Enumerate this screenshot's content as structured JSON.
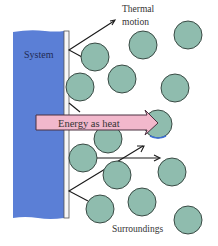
{
  "diagram": {
    "labels": {
      "system": "System",
      "thermal_motion_line1": "Thermal",
      "thermal_motion_line2": "motion",
      "energy_arrow": "Energy as heat",
      "surroundings": "Surroundings"
    },
    "colors": {
      "system_fill": "#5b7fd6",
      "wall_fill": "#f7f7f7",
      "wall_stroke": "#555555",
      "molecule_fill": "#8fbcae",
      "molecule_stroke": "#2d3b36",
      "arrow_fill": "#f2b8cc",
      "arrow_stroke": "#4a3040",
      "text_dark": "#333333",
      "system_text": "#1f2a55"
    },
    "molecules": [
      {
        "cx": 95,
        "cy": 57,
        "r": 14
      },
      {
        "cx": 143,
        "cy": 45,
        "r": 14
      },
      {
        "cx": 188,
        "cy": 35,
        "r": 14
      },
      {
        "cx": 80,
        "cy": 87,
        "r": 14
      },
      {
        "cx": 122,
        "cy": 79,
        "r": 14
      },
      {
        "cx": 175,
        "cy": 88,
        "r": 14
      },
      {
        "cx": 108,
        "cy": 139,
        "r": 14
      },
      {
        "cx": 158,
        "cy": 124,
        "r": 14
      },
      {
        "cx": 83,
        "cy": 158,
        "r": 14
      },
      {
        "cx": 117,
        "cy": 175,
        "r": 14
      },
      {
        "cx": 172,
        "cy": 172,
        "r": 14
      },
      {
        "cx": 100,
        "cy": 209,
        "r": 14
      },
      {
        "cx": 142,
        "cy": 202,
        "r": 14
      },
      {
        "cx": 188,
        "cy": 220,
        "r": 14
      }
    ]
  }
}
